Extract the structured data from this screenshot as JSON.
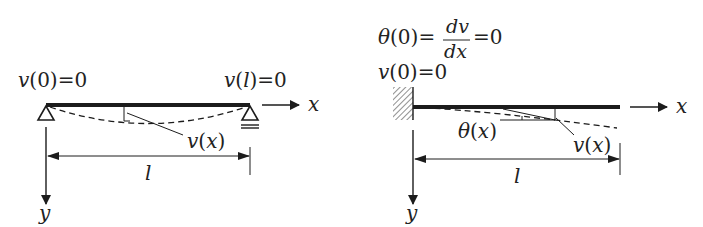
{
  "colors": {
    "ink": "#1c1c1c",
    "text": "#222222",
    "background": "#ffffff"
  },
  "left_diagram": {
    "title": "simply-supported-beam",
    "bc_left": {
      "func": "v",
      "arg": "0",
      "eq": "=0"
    },
    "bc_right": {
      "func": "v",
      "arg": "l",
      "eq": "=0"
    },
    "deflection_label": {
      "func": "v",
      "arg": "x"
    },
    "length_label": "l",
    "x_axis_label": "x",
    "y_axis_label": "y"
  },
  "right_diagram": {
    "title": "cantilever-beam",
    "bc_slope": {
      "lhs_func": "θ",
      "lhs_arg": "0",
      "eq1": "=",
      "num": "dv",
      "den": "dx",
      "eq2": "=0"
    },
    "bc_deflection": {
      "func": "v",
      "arg": "0",
      "eq": "=0"
    },
    "slope_label": {
      "func": "θ",
      "arg": "x"
    },
    "deflection_label": {
      "func": "v",
      "arg": "x"
    },
    "length_label": "l",
    "x_axis_label": "x",
    "y_axis_label": "y"
  }
}
